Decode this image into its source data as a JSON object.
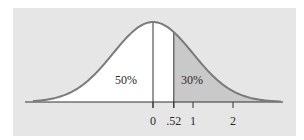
{
  "chart_data": {
    "type": "area",
    "title": "",
    "xlabel": "",
    "ylabel": "",
    "distribution": "standard normal",
    "mean": 0,
    "sd": 1,
    "x_ticks": [
      0,
      0.52,
      1,
      2
    ],
    "x_tick_labels": [
      "0",
      ".52",
      "1",
      "2"
    ],
    "xlim": [
      -3.2,
      3.25
    ],
    "vertical_lines": [
      0,
      0.52
    ],
    "regions": [
      {
        "name": "left-of-mean",
        "from": -3.2,
        "to": 0,
        "fill": "#ffffff",
        "label": "50%"
      },
      {
        "name": "mean-to-.52",
        "from": 0,
        "to": 0.52,
        "fill": "#ffffff",
        "label": ""
      },
      {
        "name": "upper-tail",
        "from": 0.52,
        "to": 3.2,
        "fill": "#c9c9c9",
        "label": "30%"
      }
    ],
    "annotations": [
      {
        "text": "50%",
        "x": -0.68,
        "y_frac": 0.28
      },
      {
        "text": "30%",
        "x": 0.97,
        "y_frac": 0.28
      }
    ],
    "grid": false,
    "legend": null
  },
  "colors": {
    "background": "#e6e6e6",
    "curve": "#7a7a7a",
    "shade": "#c9c9c9",
    "axis": "#333333"
  }
}
